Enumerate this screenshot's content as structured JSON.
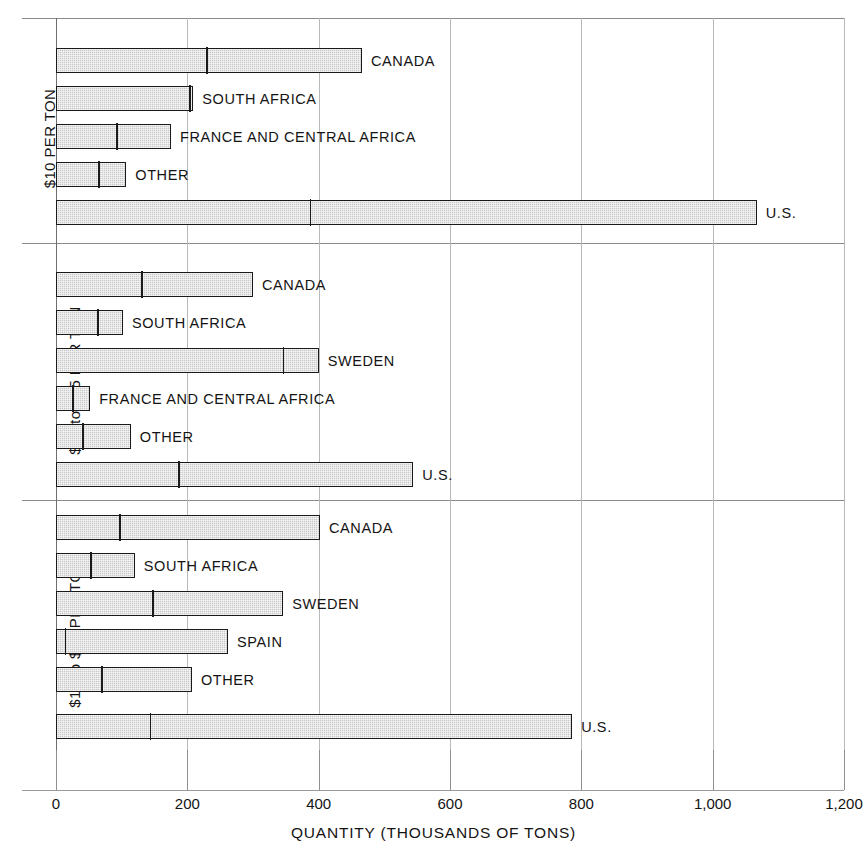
{
  "chart_data": {
    "type": "bar",
    "orientation": "horizontal",
    "title": "",
    "xlabel": "QUANTITY (THOUSANDS OF TONS)",
    "ylabel": "",
    "xlim": [
      0,
      1200
    ],
    "xticks": [
      0,
      200,
      400,
      600,
      800,
      1000,
      1200
    ],
    "xtick_labels": [
      "0",
      "200",
      "400",
      "600",
      "800",
      "1,000",
      "1,200"
    ],
    "grid": true,
    "legend": "none",
    "note": "Each bar is a single total split by an internal divider into two stacked segments.",
    "panels": [
      {
        "label": "$10 PER TON",
        "bars": [
          {
            "name": "CANADA",
            "segment1": 227,
            "segment2": 239,
            "total": 466
          },
          {
            "name": "SOUTH AFRICA",
            "segment1": 201,
            "segment2": 8,
            "total": 209
          },
          {
            "name": "FRANCE AND CENTRAL AFRICA",
            "segment1": 90,
            "segment2": 85,
            "total": 175
          },
          {
            "name": "OTHER",
            "segment1": 63,
            "segment2": 44,
            "total": 107
          },
          {
            "name": "U.S.",
            "segment1": 385,
            "segment2": 682,
            "total": 1067
          }
        ]
      },
      {
        "label": "$10 to $15 PER TON",
        "bars": [
          {
            "name": "CANADA",
            "segment1": 128,
            "segment2": 172,
            "total": 300
          },
          {
            "name": "SOUTH AFRICA",
            "segment1": 61,
            "segment2": 41,
            "total": 102
          },
          {
            "name": "SWEDEN",
            "segment1": 344,
            "segment2": 56,
            "total": 400
          },
          {
            "name": "FRANCE AND CENTRAL AFRICA",
            "segment1": 23,
            "segment2": 29,
            "total": 52
          },
          {
            "name": "OTHER",
            "segment1": 38,
            "segment2": 76,
            "total": 114
          },
          {
            "name": "U.S.",
            "segment1": 185,
            "segment2": 359,
            "total": 544
          }
        ]
      },
      {
        "label": "$15 to $30 PER TON",
        "bars": [
          {
            "name": "CANADA",
            "segment1": 95,
            "segment2": 307,
            "total": 402
          },
          {
            "name": "SOUTH AFRICA",
            "segment1": 51,
            "segment2": 69,
            "total": 120
          },
          {
            "name": "SWEDEN",
            "segment1": 145,
            "segment2": 201,
            "total": 346
          },
          {
            "name": "SPAIN",
            "segment1": 12,
            "segment2": 250,
            "total": 262
          },
          {
            "name": "OTHER",
            "segment1": 67,
            "segment2": 140,
            "total": 207
          },
          {
            "name": "U.S.",
            "segment1": 141,
            "segment2": 645,
            "total": 786
          }
        ]
      }
    ]
  },
  "axis": {
    "x_title": "QUANTITY (THOUSANDS OF TONS)",
    "tick_labels": [
      "0",
      "200",
      "400",
      "600",
      "800",
      "1,000",
      "1,200"
    ]
  },
  "panel_captions": [
    "$10 PER TON",
    "$10 to $15 PER TON",
    "$15 to $30 PER TON"
  ],
  "colors": {
    "bar_fill": "#c9c9c9",
    "bar_stroke": "#1a1a1a",
    "gridline": "#b9b9b9",
    "text": "#141414"
  }
}
